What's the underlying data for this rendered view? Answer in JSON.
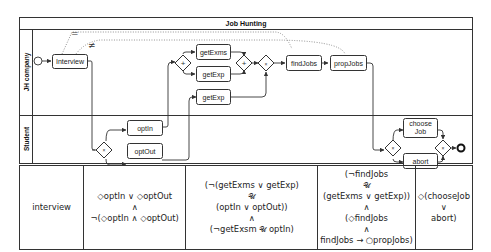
{
  "pool": {
    "title": "Job Hunting",
    "lanes": [
      {
        "label": "JH company"
      },
      {
        "label": "Student"
      }
    ]
  },
  "tasks": {
    "interview": "Interview",
    "getExms": "getExms",
    "getExp1": "getExp",
    "getExp2": "getExp",
    "findJobs": "findJobs",
    "propJobs": "propJobs",
    "optIn": "optIn",
    "optOut": "optOut",
    "chooseJob_l1": "choose",
    "chooseJob_l2": "Job",
    "abort": "abort"
  },
  "gateways": {
    "parallel_symbol": "+",
    "exclusive_symbol": "×"
  },
  "annotations": {
    "equal": "=",
    "not_equal": "≠"
  },
  "table": {
    "columns": [
      {
        "lines": [
          "interview"
        ]
      },
      {
        "lines": [
          "◇optIn ∨ ◇optOut",
          "∧",
          "¬(◇optIn ∧ ◇optOut)"
        ]
      },
      {
        "lines": [
          "(¬(getExms ∨ getExp)",
          "𝒰",
          "(optIn ∨ optOut))",
          "∧",
          "(¬getExsm 𝒰 optIn)"
        ]
      },
      {
        "lines": [
          "(¬findJobs",
          "𝒰",
          "(getExms ∨ getExp))",
          "∧",
          "(◇findJobs",
          "∧",
          "findJobs → ○propJobs)"
        ]
      },
      {
        "lines": [
          "◇(chooseJob",
          "∨",
          "abort)"
        ]
      }
    ]
  },
  "colors": {
    "stroke": "#333333",
    "task_fill": "#ffffff",
    "dotted": "#777777"
  }
}
